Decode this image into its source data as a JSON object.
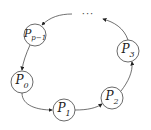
{
  "diagram": {
    "type": "ring",
    "nodes": [
      {
        "id": "p0",
        "base": "P",
        "sub": "0",
        "x": 22,
        "y": 82
      },
      {
        "id": "p1",
        "base": "P",
        "sub": "1",
        "x": 64,
        "y": 110
      },
      {
        "id": "p2",
        "base": "P",
        "sub": "2",
        "x": 112,
        "y": 98
      },
      {
        "id": "p3",
        "base": "P",
        "sub": "3",
        "x": 128,
        "y": 51
      },
      {
        "id": "pp1",
        "base": "P",
        "sub": "p−1",
        "x": 35,
        "y": 35
      }
    ],
    "ellipsis": "···",
    "edges": [
      {
        "from": "p0",
        "to": "p1"
      },
      {
        "from": "p1",
        "to": "p2"
      },
      {
        "from": "p2",
        "to": "p3"
      },
      {
        "from": "p3",
        "to": "ellipsis"
      },
      {
        "from": "ellipsis",
        "to": "pp1"
      },
      {
        "from": "pp1",
        "to": "p0"
      }
    ]
  }
}
